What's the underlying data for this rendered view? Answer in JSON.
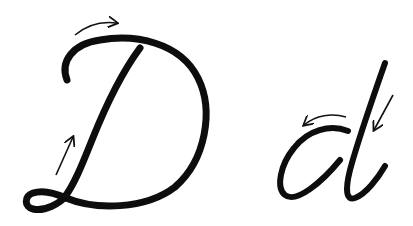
{
  "diagram": {
    "background": "#ffffff",
    "stroke_color": "#0d0d0d",
    "arrow_color": "#111111",
    "letters": [
      {
        "glyph": "D",
        "case": "uppercase",
        "arrows": [
          {
            "name": "top-arc-arrow",
            "direction": "right"
          },
          {
            "name": "stem-up-arrow",
            "direction": "up-right"
          }
        ]
      },
      {
        "glyph": "d",
        "case": "lowercase",
        "arrows": [
          {
            "name": "bowl-arc-arrow",
            "direction": "left"
          },
          {
            "name": "stem-down-arrow",
            "direction": "down-left"
          }
        ]
      }
    ]
  }
}
